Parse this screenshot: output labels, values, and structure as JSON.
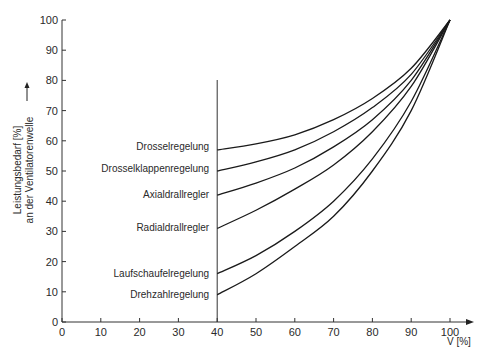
{
  "chart_data": {
    "type": "line",
    "title": "",
    "xlabel": "V̇ [%]",
    "ylabel": "Leistungsbedarf [%] an der Ventilatorenwelle",
    "ylabel_lines": [
      "Leistungsbedarf [%]",
      "an der Ventilatorenwelle"
    ],
    "xlim": [
      0,
      100
    ],
    "ylim": [
      0,
      100
    ],
    "xticks": [
      0,
      10,
      20,
      30,
      40,
      50,
      60,
      70,
      80,
      90,
      100
    ],
    "yticks": [
      0,
      10,
      20,
      30,
      40,
      50,
      60,
      70,
      80,
      90,
      100
    ],
    "grid": false,
    "legend_position": "inline-left-of-x40",
    "vertical_marker_x": 40,
    "x": [
      40,
      50,
      60,
      70,
      80,
      90,
      100
    ],
    "series": [
      {
        "name": "Drosselregelung",
        "values": [
          57,
          59,
          62,
          67,
          74,
          84,
          100
        ]
      },
      {
        "name": "Drosselklappenregelung",
        "values": [
          50,
          53,
          57,
          63,
          71,
          82,
          100
        ]
      },
      {
        "name": "Axialdrallregler",
        "values": [
          42,
          46,
          51,
          58,
          67,
          80,
          100
        ]
      },
      {
        "name": "Radialdrallregler",
        "values": [
          31,
          37,
          44,
          52,
          63,
          78,
          100
        ]
      },
      {
        "name": "Laufschaufelregelung",
        "values": [
          16,
          22,
          30,
          40,
          54,
          73,
          100
        ]
      },
      {
        "name": "Drehzahlregelung",
        "values": [
          9,
          16,
          25,
          35,
          50,
          70,
          100
        ]
      }
    ]
  },
  "axis_labels": {
    "x": "V̇ [%]",
    "y_line1": "Leistungsbedarf [%]",
    "y_line2": "an der Ventilatorenwelle"
  },
  "series_labels": [
    "Drosselregelung",
    "Drosselklappenregelung",
    "Axialdrallregler",
    "Radialdrallregler",
    "Laufschaufelregelung",
    "Drehzahlregelung"
  ]
}
